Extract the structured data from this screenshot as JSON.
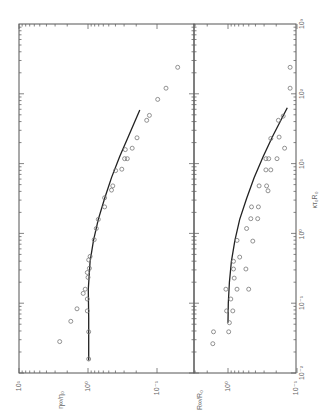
{
  "chart_data": [
    {
      "type": "scatter",
      "panel": "top (left when rotated)",
      "orientation": "figure rotated 90 degrees counter-clockwise",
      "xlabel": "κτ₀R₀",
      "ylabel": "η∞/η₀",
      "xscale": "log",
      "yscale": "log",
      "xlim": [
        0.01,
        1000
      ],
      "ylim": [
        0.1,
        10
      ],
      "x_ticks": [
        "10⁻²",
        "10⁻¹",
        "10⁰",
        "10¹",
        "10²",
        "10³"
      ],
      "y_ticks": [
        "10⁻¹",
        "10⁰",
        "10¹"
      ],
      "points_log10": [
        [
          2.38,
          -1.3
        ],
        [
          2.08,
          -1.13
        ],
        [
          1.92,
          -1.01
        ],
        [
          1.69,
          -0.89
        ],
        [
          1.62,
          -0.85
        ],
        [
          1.37,
          -0.71
        ],
        [
          1.22,
          -0.64
        ],
        [
          1.2,
          -0.54
        ],
        [
          1.07,
          -0.57
        ],
        [
          1.07,
          -0.53
        ],
        [
          0.92,
          -0.49
        ],
        [
          0.9,
          -0.4
        ],
        [
          0.68,
          -0.36
        ],
        [
          0.62,
          -0.34
        ],
        [
          0.51,
          -0.24
        ],
        [
          0.38,
          -0.24
        ],
        [
          0.2,
          -0.15
        ],
        [
          0.07,
          -0.12
        ],
        [
          -0.09,
          -0.09
        ],
        [
          -0.33,
          -0.03
        ],
        [
          -0.38,
          -0.01
        ],
        [
          -0.5,
          -0.02
        ],
        [
          -0.56,
          0.01
        ],
        [
          -0.63,
          0.0
        ],
        [
          -0.8,
          0.04
        ],
        [
          -0.86,
          0.07
        ],
        [
          -0.94,
          0.01
        ],
        [
          -1.08,
          0.16
        ],
        [
          -1.11,
          0.01
        ],
        [
          -1.26,
          0.25
        ],
        [
          -1.41,
          -0.01
        ],
        [
          -1.55,
          0.41
        ],
        [
          -1.8,
          -0.01
        ]
      ],
      "curve_log10": [
        [
          -1.82,
          -0.01
        ],
        [
          -1.2,
          -0.01
        ],
        [
          -0.8,
          -0.005
        ],
        [
          -0.4,
          -0.03
        ],
        [
          -0.1,
          -0.08
        ],
        [
          0.2,
          -0.15
        ],
        [
          0.5,
          -0.24
        ],
        [
          0.8,
          -0.34
        ],
        [
          1.1,
          -0.46
        ],
        [
          1.4,
          -0.59
        ],
        [
          1.77,
          -0.75
        ]
      ]
    },
    {
      "type": "scatter",
      "panel": "bottom (right when rotated)",
      "xlabel": "κτ₀R₀",
      "ylabel": "R∞/R₀",
      "xscale": "log",
      "yscale": "log",
      "xlim": [
        0.01,
        1000
      ],
      "ylim": [
        0.1,
        3.1
      ],
      "x_ticks": [
        "10⁻²",
        "10⁻¹",
        "10⁰",
        "10¹",
        "10²",
        "10³"
      ],
      "y_ticks": [
        "10⁻¹",
        "10⁰"
      ],
      "points_log10": [
        [
          2.38,
          -0.9
        ],
        [
          2.08,
          -0.9
        ],
        [
          1.68,
          -0.8
        ],
        [
          1.62,
          -0.73
        ],
        [
          1.38,
          -0.74
        ],
        [
          1.36,
          -0.62
        ],
        [
          1.22,
          -0.82
        ],
        [
          1.07,
          -0.71
        ],
        [
          1.07,
          -0.59
        ],
        [
          1.07,
          -0.55
        ],
        [
          0.91,
          -0.62
        ],
        [
          0.91,
          -0.55
        ],
        [
          0.68,
          -0.45
        ],
        [
          0.68,
          -0.56
        ],
        [
          0.61,
          -0.58
        ],
        [
          0.38,
          -0.34
        ],
        [
          0.38,
          -0.44
        ],
        [
          0.21,
          -0.33
        ],
        [
          0.21,
          -0.43
        ],
        [
          0.07,
          -0.27
        ],
        [
          -0.1,
          -0.13
        ],
        [
          -0.11,
          -0.36
        ],
        [
          -0.34,
          -0.17
        ],
        [
          -0.4,
          -0.08
        ],
        [
          -0.51,
          -0.08
        ],
        [
          -0.51,
          -0.26
        ],
        [
          -0.64,
          -0.09
        ],
        [
          -0.8,
          0.03
        ],
        [
          -0.8,
          -0.13
        ],
        [
          -0.8,
          -0.3
        ],
        [
          -0.94,
          -0.04
        ],
        [
          -1.11,
          0.02
        ],
        [
          -1.11,
          -0.07
        ],
        [
          -1.28,
          -0.02
        ],
        [
          -1.41,
          0.21
        ],
        [
          -1.41,
          -0.01
        ],
        [
          -1.58,
          0.22
        ]
      ],
      "curve_log10": [
        [
          -1.28,
          0.0
        ],
        [
          -1.0,
          -0.005
        ],
        [
          -0.7,
          -0.02
        ],
        [
          -0.4,
          -0.05
        ],
        [
          -0.1,
          -0.1
        ],
        [
          0.2,
          -0.17
        ],
        [
          0.5,
          -0.27
        ],
        [
          0.8,
          -0.38
        ],
        [
          1.1,
          -0.51
        ],
        [
          1.4,
          -0.65
        ],
        [
          1.8,
          -0.86
        ]
      ]
    }
  ],
  "labels": {
    "x_axis_label": "κτ₀R₀",
    "top_y_label": "η∞/η₀",
    "bottom_y_label": "R∞/R₀",
    "x_ticks": [
      "10⁻²",
      "10⁻¹",
      "10⁰",
      "10¹",
      "10²",
      "10³"
    ],
    "top_y_ticks": [
      "10¹",
      "10⁰",
      "10⁻¹"
    ],
    "bottom_y_ticks": [
      "10⁰",
      "10⁻¹"
    ]
  }
}
